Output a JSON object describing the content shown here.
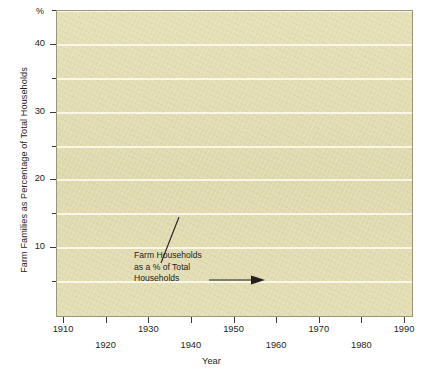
{
  "chart_data": {
    "type": "line",
    "title": "",
    "xlabel": "Year",
    "ylabel": "Farm Families as Percentage of Total Households",
    "unit_symbol": "%",
    "annotations": [
      {
        "name": "series-callout",
        "lines": [
          "Farm Households",
          "as a % of Total",
          "Households"
        ],
        "has_leader_line": true,
        "has_arrow": true
      }
    ],
    "xlim": [
      1910,
      1990
    ],
    "ylim": [
      0,
      45
    ],
    "xticks": [
      1910,
      1920,
      1930,
      1940,
      1950,
      1960,
      1970,
      1980,
      1990
    ],
    "xtick_labels": [
      "1910",
      "1920",
      "1930",
      "1940",
      "1950",
      "1960",
      "1970",
      "1980",
      "1990"
    ],
    "yticks": [
      10,
      20,
      30,
      40
    ],
    "ytick_labels": [
      "10",
      "20",
      "30",
      "40"
    ],
    "yticks_minor": [
      5,
      15,
      25,
      35,
      45
    ],
    "grid": "horizontal",
    "legend": "none",
    "series": [
      {
        "name": "Farm Households as a % of Total Households",
        "band_color": "#1d6fae",
        "marker_color": "#5f9e4a",
        "x": [
          1910,
          1915,
          1920,
          1925,
          1930,
          1935,
          1940,
          1945,
          1950,
          1955,
          1960,
          1965,
          1970,
          1975,
          1980,
          1985,
          1990
        ],
        "values": [
          31.2,
          29.0,
          26.8,
          24.8,
          22.4,
          20.0,
          17.6,
          15.7,
          13.7,
          11.3,
          9.0,
          7.2,
          5.4,
          4.3,
          3.2,
          2.4,
          1.6
        ],
        "labeled_points": [
          1910,
          1920,
          1930,
          1940,
          1950,
          1960,
          1970,
          1980,
          1990
        ]
      }
    ]
  },
  "colors": {
    "plot_background": "#e2ddb2",
    "gridline": "#fbf8e9",
    "band": "#1d6fae",
    "marker": "#5f9e4a",
    "axis": "#3b3a33",
    "text": "#231f20",
    "page_background": "#ffffff"
  }
}
